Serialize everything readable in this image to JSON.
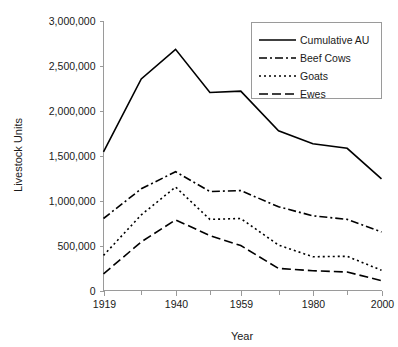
{
  "chart_data": {
    "type": "line",
    "title": "",
    "xlabel": "Year",
    "ylabel": "Livestock Units",
    "x": [
      1919,
      1930,
      1940,
      1950,
      1959,
      1970,
      1980,
      1990,
      2000
    ],
    "xlim": [
      1919,
      2000
    ],
    "ylim": [
      0,
      3000000
    ],
    "xticks": [
      1919,
      1940,
      1959,
      1980,
      2000
    ],
    "xtick_labels": [
      "1919",
      "1940",
      "1959",
      "1980",
      "2000"
    ],
    "yticks": [
      0,
      500000,
      1000000,
      1500000,
      2000000,
      2500000,
      3000000
    ],
    "ytick_labels": [
      "0",
      "500,000",
      "1,000,000",
      "1,500,000",
      "2,000,000",
      "2,500,000",
      "3,000,000"
    ],
    "grid": false,
    "legend_position": "top-right",
    "series": [
      {
        "name": "Cumulative AU",
        "style": "solid",
        "color": "#000000",
        "values": [
          1540000,
          2350000,
          2680000,
          2200000,
          2215000,
          1775000,
          1630000,
          1580000,
          1240000
        ]
      },
      {
        "name": "Beef Cows",
        "style": "dash-dot",
        "color": "#000000",
        "values": [
          800000,
          1130000,
          1320000,
          1100000,
          1110000,
          930000,
          830000,
          790000,
          650000
        ]
      },
      {
        "name": "Goats",
        "style": "dotted",
        "color": "#000000",
        "values": [
          390000,
          840000,
          1150000,
          790000,
          800000,
          505000,
          375000,
          380000,
          225000
        ]
      },
      {
        "name": "Ewes",
        "style": "dashed",
        "color": "#000000",
        "values": [
          185000,
          540000,
          785000,
          610000,
          500000,
          245000,
          220000,
          205000,
          110000
        ]
      }
    ]
  },
  "axis": {
    "x_title": "Year",
    "y_title": "Livestock Units"
  },
  "legend": {
    "entries": [
      {
        "label": "Cumulative AU"
      },
      {
        "label": "Beef Cows"
      },
      {
        "label": "Goats"
      },
      {
        "label": "Ewes"
      }
    ]
  }
}
